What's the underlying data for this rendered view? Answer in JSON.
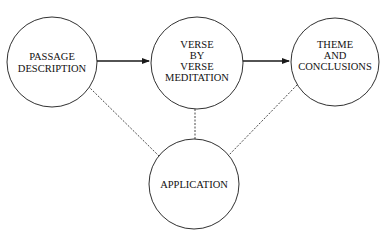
{
  "diagram": {
    "nodes": [
      {
        "id": "passage",
        "lines": [
          "PASSAGE",
          "DESCRIPTION"
        ]
      },
      {
        "id": "verse",
        "lines": [
          "VERSE",
          "BY",
          "VERSE",
          "MEDITATION"
        ]
      },
      {
        "id": "theme",
        "lines": [
          "THEME",
          "AND",
          "CONCLUSIONS"
        ]
      },
      {
        "id": "application",
        "lines": [
          "APPLICATION"
        ]
      }
    ],
    "edges": [
      {
        "from": "passage",
        "to": "verse",
        "style": "solid-arrow"
      },
      {
        "from": "verse",
        "to": "theme",
        "style": "solid-arrow"
      },
      {
        "from": "passage",
        "to": "application",
        "style": "dashed"
      },
      {
        "from": "verse",
        "to": "application",
        "style": "dashed"
      },
      {
        "from": "theme",
        "to": "application",
        "style": "dashed"
      }
    ],
    "colors": {
      "stroke": "#1a1a1a",
      "background": "#ffffff"
    }
  }
}
